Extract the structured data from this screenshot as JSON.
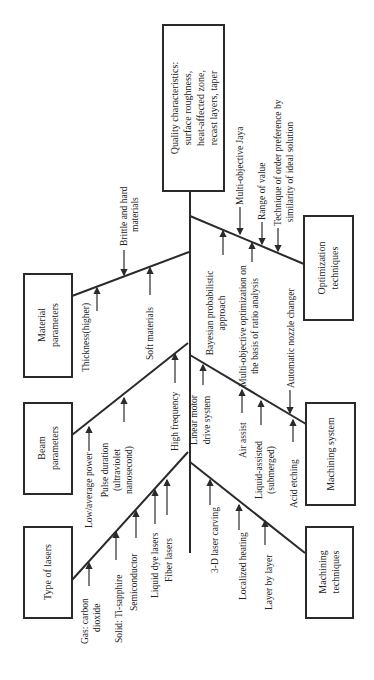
{
  "diagram": {
    "type": "fishbone",
    "orientation": "rotated 90° counterclockwise (head at top)",
    "head": {
      "lines": [
        "Quality characteristics:",
        "surface roughness,",
        "heat-affected zone,",
        "recast layers, taper"
      ]
    },
    "categories": {
      "material": {
        "lines": [
          "Material",
          "parameters"
        ],
        "causes": [
          {
            "lines": [
              "Brittle and hard",
              "materials"
            ]
          },
          {
            "lines": [
              "Thickness(higher)"
            ]
          },
          {
            "lines": [
              "Soft materials"
            ]
          }
        ]
      },
      "beam": {
        "lines": [
          "Beam",
          "parameters"
        ],
        "causes": [
          {
            "lines": [
              "Low/average power"
            ]
          },
          {
            "lines": [
              "Pulse duration",
              "(ultraviolet",
              "nanosecond)"
            ]
          },
          {
            "lines": [
              "High frequency"
            ]
          }
        ]
      },
      "lasers": {
        "lines": [
          "Type of lasers"
        ],
        "causes": [
          {
            "lines": [
              "Gas: carbon",
              "dioxide"
            ]
          },
          {
            "lines": [
              "Solid: Ti-sapphire"
            ]
          },
          {
            "lines": [
              "Semiconductor"
            ]
          },
          {
            "lines": [
              "Liquid dye lasers"
            ]
          },
          {
            "lines": [
              "Fiber lasers"
            ]
          }
        ]
      },
      "optimization": {
        "lines": [
          "Optimization",
          "techniques"
        ],
        "causes": [
          {
            "lines": [
              "Multi-objective Jaya"
            ]
          },
          {
            "lines": [
              "Range of value"
            ]
          },
          {
            "lines": [
              "Technique of order preference by",
              "similarity of ideal solution"
            ]
          },
          {
            "lines": [
              "Bayesian probabilistic",
              "approach"
            ]
          },
          {
            "lines": [
              "Multi-objective optimization on",
              "the basis of ratio analysis"
            ]
          }
        ]
      },
      "machining_system": {
        "lines": [
          "Machining system"
        ],
        "causes": [
          {
            "lines": [
              "Automatic nozzle changer"
            ]
          },
          {
            "lines": [
              "Linear motor",
              "drive system"
            ]
          },
          {
            "lines": [
              "Air assist"
            ]
          },
          {
            "lines": [
              "Liquid-assisted",
              "(submerged)"
            ]
          },
          {
            "lines": [
              "Acid etching"
            ]
          }
        ]
      },
      "machining_techniques": {
        "lines": [
          "Machining",
          "techniques"
        ],
        "causes": [
          {
            "lines": [
              "3-D laser carving"
            ]
          },
          {
            "lines": [
              "Localized heating"
            ]
          },
          {
            "lines": [
              "Layer by layer"
            ]
          }
        ]
      }
    }
  }
}
